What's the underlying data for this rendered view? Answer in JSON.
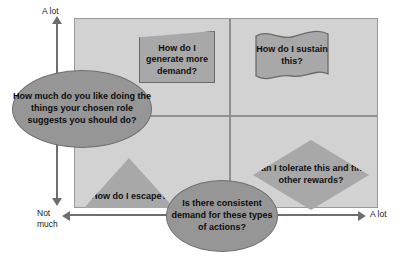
{
  "diagram": {
    "colors": {
      "plot_background": "#d2d2d2",
      "shape_fill": "#a8a8a8",
      "ellipse_fill": "#969696",
      "line": "#8f8f8f",
      "axis": "#6e6e6e",
      "text": "#111111",
      "page_background": "#ffffff"
    }
  },
  "axes": {
    "y": {
      "top_label": "A lot",
      "bottom_label": "Not\nmuch",
      "question": "How much do you like doing the things your chosen role suggests you should do?"
    },
    "x": {
      "left_label": "Not\nmuch",
      "right_label": "A lot",
      "question": "Is there consistent demand for these types of actions?"
    }
  },
  "quadrants": [
    {
      "position": "top-left",
      "shape": "trapezoid",
      "text": "How do I generate more demand?"
    },
    {
      "position": "top-right",
      "shape": "flag",
      "text": "How do I sustain this?"
    },
    {
      "position": "bottom-left",
      "shape": "triangle",
      "text": "How do I escape?"
    },
    {
      "position": "bottom-right",
      "shape": "diamond",
      "text": "Can I tolerate this and find other rewards?"
    }
  ]
}
